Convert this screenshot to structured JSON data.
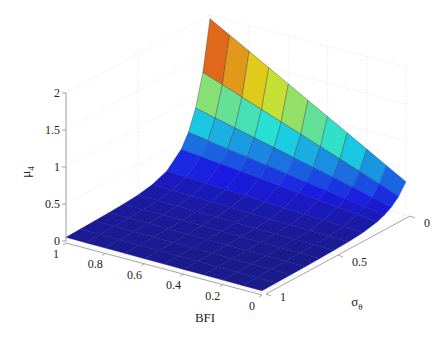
{
  "chart_data": {
    "type": "surface3d",
    "title": "",
    "xlabel": "BFI",
    "ylabel": "σθ",
    "zlabel": "μ4",
    "x_ticks": [
      "1",
      "0.8",
      "0.6",
      "0.4",
      "0.2",
      "0"
    ],
    "y_ticks": [
      "1",
      "0.5",
      "0"
    ],
    "z_ticks": [
      "0",
      "0.5",
      "1",
      "1.5",
      "2"
    ],
    "xlim": [
      0,
      1
    ],
    "ylim": [
      0,
      1
    ],
    "zlim": [
      0,
      2
    ],
    "grid": true,
    "colormap": "jet",
    "x": [
      1.0,
      0.9,
      0.8,
      0.7,
      0.6,
      0.5,
      0.4,
      0.3,
      0.2,
      0.1,
      0.0
    ],
    "y": [
      0.0,
      0.05,
      0.1,
      0.15,
      0.2,
      0.3,
      0.4,
      0.5,
      0.6,
      0.7,
      0.8,
      0.9,
      1.0
    ],
    "z_description": "μ4 peaks near 2 at BFI=1, σθ=0, decreasing toward ~0.4 at BFI=0, σθ=0; drops rapidly toward ~0 as σθ increases; near 0 for σθ≥0.5",
    "z_at_sigma0": [
      1.95,
      1.8,
      1.65,
      1.5,
      1.35,
      1.2,
      1.05,
      0.9,
      0.75,
      0.6,
      0.45
    ],
    "colorbar": false,
    "legend": false
  },
  "axes": {
    "z_label": "μ",
    "z_label_sub": "4",
    "x_label": "BFI",
    "y_label": "σ",
    "y_label_sub": "θ"
  }
}
